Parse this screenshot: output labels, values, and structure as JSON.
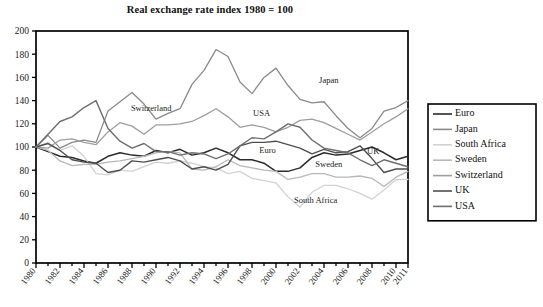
{
  "chart_data": {
    "type": "line",
    "title": "Real exchange rate index 1980 = 100",
    "xlabel": "",
    "ylabel": "",
    "xlim": [
      1980,
      2011
    ],
    "ylim": [
      0,
      200
    ],
    "ytick_step": 20,
    "yticks": [
      0,
      20,
      40,
      60,
      80,
      100,
      120,
      140,
      160,
      180,
      200
    ],
    "xticks": [
      1980,
      1982,
      1984,
      1986,
      1988,
      1990,
      1992,
      1994,
      1996,
      1998,
      2000,
      2002,
      2004,
      2006,
      2008,
      2010,
      2011
    ],
    "xticks_minor": [
      1981,
      1983,
      1985,
      1987,
      1989,
      1991,
      1993,
      1995,
      1997,
      1999,
      2001,
      2003,
      2005,
      2007,
      2009
    ],
    "grid": false,
    "legend_position": "right-outside",
    "x": [
      1980,
      1981,
      1982,
      1983,
      1984,
      1985,
      1986,
      1987,
      1988,
      1989,
      1990,
      1991,
      1992,
      1993,
      1994,
      1995,
      1996,
      1997,
      1998,
      1999,
      2000,
      2001,
      2002,
      2003,
      2004,
      2005,
      2006,
      2007,
      2008,
      2009,
      2010,
      2011
    ],
    "series": [
      {
        "name": "Euro",
        "color": "#2b2b2b",
        "width": 1.5,
        "values": [
          100,
          96,
          92,
          91,
          88,
          86,
          92,
          95,
          93,
          92,
          97,
          95,
          98,
          93,
          95,
          99,
          95,
          89,
          89,
          86,
          79,
          79,
          82,
          91,
          95,
          93,
          94,
          97,
          100,
          95,
          89,
          92
        ]
      },
      {
        "name": "Japan",
        "color": "#8a8a8a",
        "width": 1.3,
        "values": [
          100,
          110,
          99,
          104,
          106,
          104,
          131,
          139,
          147,
          137,
          124,
          129,
          133,
          154,
          166,
          184,
          178,
          156,
          146,
          160,
          168,
          153,
          141,
          138,
          139,
          127,
          116,
          108,
          116,
          131,
          134,
          140
        ]
      },
      {
        "name": "South Africa",
        "color": "#d2d2d2",
        "width": 1.3,
        "values": [
          100,
          104,
          97,
          101,
          92,
          77,
          76,
          80,
          79,
          83,
          87,
          86,
          88,
          86,
          83,
          82,
          77,
          79,
          73,
          71,
          69,
          57,
          48,
          61,
          67,
          67,
          64,
          60,
          55,
          63,
          72,
          72
        ]
      },
      {
        "name": "Sweden",
        "color": "#b8b8b8",
        "width": 1.3,
        "values": [
          100,
          97,
          88,
          84,
          85,
          85,
          87,
          88,
          90,
          92,
          95,
          96,
          95,
          81,
          80,
          83,
          89,
          84,
          82,
          80,
          79,
          72,
          74,
          77,
          77,
          74,
          74,
          75,
          73,
          66,
          74,
          79
        ]
      },
      {
        "name": "Switzerland",
        "color": "#9e9e9e",
        "width": 1.3,
        "values": [
          100,
          99,
          106,
          107,
          104,
          102,
          113,
          121,
          118,
          111,
          119,
          119,
          120,
          122,
          127,
          133,
          126,
          117,
          119,
          117,
          113,
          117,
          123,
          124,
          121,
          116,
          111,
          106,
          113,
          120,
          126,
          133
        ]
      },
      {
        "name": "UK",
        "color": "#4f4f4f",
        "width": 1.4,
        "values": [
          100,
          103,
          97,
          89,
          87,
          86,
          78,
          80,
          88,
          87,
          89,
          91,
          88,
          81,
          83,
          80,
          85,
          101,
          104,
          104,
          105,
          102,
          99,
          94,
          98,
          95,
          96,
          101,
          90,
          78,
          81,
          81
        ]
      },
      {
        "name": "USA",
        "color": "#6e6e6e",
        "width": 1.4,
        "values": [
          100,
          111,
          122,
          126,
          134,
          140,
          116,
          105,
          99,
          103,
          96,
          96,
          93,
          95,
          94,
          90,
          94,
          101,
          108,
          107,
          113,
          120,
          117,
          106,
          99,
          97,
          95,
          89,
          84,
          89,
          86,
          83
        ]
      }
    ],
    "inline_annotations": [
      {
        "text": "Switzerland",
        "x": 1989.6,
        "y": 131
      },
      {
        "text": "USA",
        "x": 1998.8,
        "y": 127
      },
      {
        "text": "Japan",
        "x": 2004.4,
        "y": 155
      },
      {
        "text": "Euro",
        "x": 1999.3,
        "y": 95
      },
      {
        "text": "Sweden",
        "x": 2004.4,
        "y": 83
      },
      {
        "text": "UK",
        "x": 2008.1,
        "y": 94
      },
      {
        "text": "South Africa",
        "x": 2003.3,
        "y": 52
      }
    ],
    "legend_entries": [
      {
        "label": "Euro",
        "color": "#2b2b2b"
      },
      {
        "label": "Japan",
        "color": "#8a8a8a"
      },
      {
        "label": "South Africa",
        "color": "#d2d2d2"
      },
      {
        "label": "Sweden",
        "color": "#b8b8b8"
      },
      {
        "label": "Switzerland",
        "color": "#9e9e9e"
      },
      {
        "label": "UK",
        "color": "#4f4f4f"
      },
      {
        "label": "USA",
        "color": "#6e6e6e"
      }
    ]
  }
}
